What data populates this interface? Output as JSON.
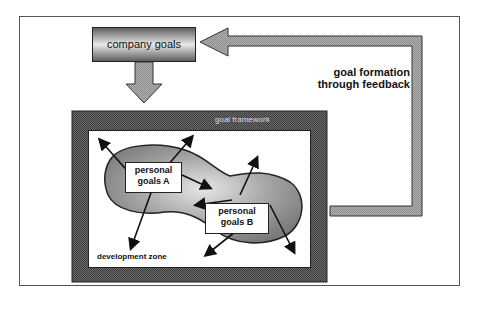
{
  "diagram": {
    "company_goals": "company goals",
    "feedback_label_line1": "goal formation",
    "feedback_label_line2": "through feedback",
    "framework_label": "goal framework",
    "personal_goals_a_line1": "personal",
    "personal_goals_a_line2": "goals A",
    "personal_goals_b_line1": "personal",
    "personal_goals_b_line2": "goals B",
    "development_zone": "development zone"
  },
  "colors": {
    "frame_dark": "#555555",
    "arrow_gray": "#a8a8a8",
    "blob_gray": "#8c8c8c",
    "outline": "#222222"
  }
}
